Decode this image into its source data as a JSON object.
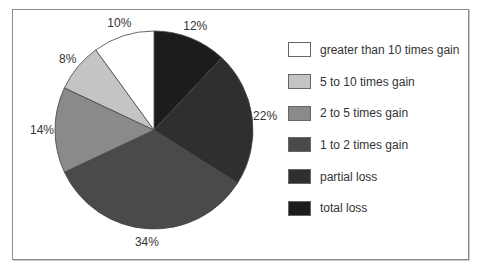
{
  "chart_data": {
    "type": "pie",
    "title": "",
    "categories": [
      "total loss",
      "partial loss",
      "1 to 2 times gain",
      "2 to 5 times gain",
      "5 to 10 times gain",
      "greater than 10 times gain"
    ],
    "values": [
      12,
      22,
      34,
      14,
      8,
      10
    ],
    "labels": [
      "12%",
      "22%",
      "34%",
      "14%",
      "8%",
      "10%"
    ],
    "colors": [
      "#1c1c1c",
      "#2f2f2f",
      "#4a4a4a",
      "#8a8a8a",
      "#c4c4c4",
      "#ffffff"
    ],
    "start_angle_deg": 90,
    "direction": "clockwise",
    "legend_position": "right",
    "legend_order": [
      "greater than 10 times gain",
      "5 to 10 times gain",
      "2 to 5 times gain",
      "1 to 2 times gain",
      "partial loss",
      "total loss"
    ]
  },
  "legend": [
    {
      "label": "greater than 10 times gain",
      "color": "#ffffff"
    },
    {
      "label": "5 to 10 times gain",
      "color": "#c4c4c4"
    },
    {
      "label": "2 to 5 times gain",
      "color": "#8a8a8a"
    },
    {
      "label": "1 to 2 times gain",
      "color": "#4a4a4a"
    },
    {
      "label": "partial loss",
      "color": "#2f2f2f"
    },
    {
      "label": "total loss",
      "color": "#1c1c1c"
    }
  ]
}
